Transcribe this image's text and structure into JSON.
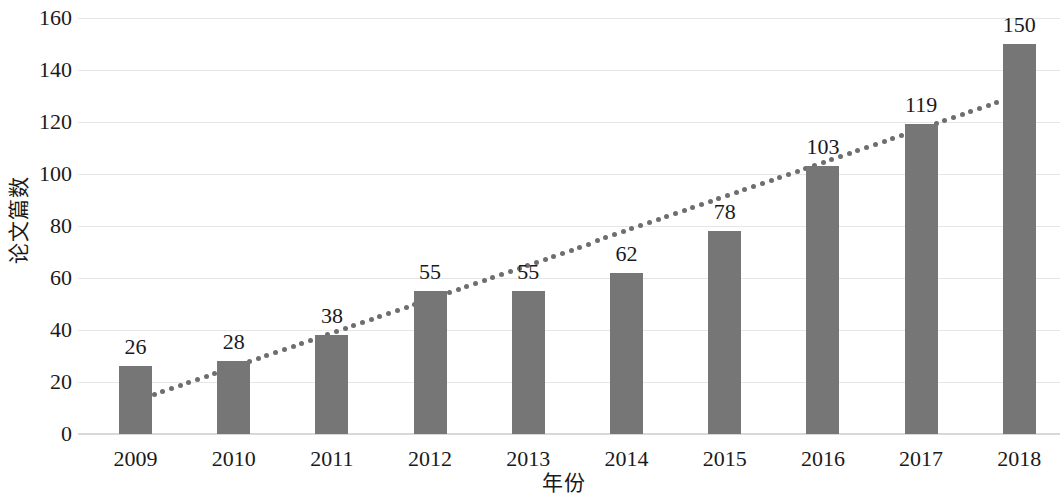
{
  "chart_data": {
    "type": "bar",
    "title": "",
    "xlabel": "年份",
    "ylabel": "论文篇数",
    "categories": [
      "2009",
      "2010",
      "2011",
      "2012",
      "2013",
      "2014",
      "2015",
      "2016",
      "2017",
      "2018"
    ],
    "values": [
      26,
      28,
      38,
      55,
      55,
      62,
      78,
      103,
      119,
      150
    ],
    "ylim": [
      0,
      160
    ],
    "ytick_labels": [
      "0",
      "20",
      "40",
      "60",
      "80",
      "100",
      "120",
      "140",
      "160"
    ],
    "ytick_values": [
      0,
      20,
      40,
      60,
      80,
      100,
      120,
      140,
      160
    ],
    "grid": true,
    "legend": "none",
    "series": [
      {
        "name": "论文篇数",
        "type": "bar",
        "color": "#767676",
        "values": [
          26,
          28,
          38,
          55,
          55,
          62,
          78,
          103,
          119,
          150
        ],
        "data_labels": [
          "26",
          "28",
          "38",
          "55",
          "55",
          "62",
          "78",
          "103",
          "119",
          "150"
        ]
      },
      {
        "name": "趋势线",
        "type": "trendline",
        "style": "dotted",
        "color": "#6e6e6e",
        "start_value": 15,
        "end_value": 128
      }
    ]
  },
  "axis": {
    "y_title": "论文篇数",
    "x_title": "年份"
  },
  "colors": {
    "bar": "#767676",
    "trendline": "#6e6e6e",
    "gridline": "#e6e6e6",
    "baseline": "#d8d8d8",
    "background": "#ffffff",
    "text": "#1a1a1a"
  }
}
